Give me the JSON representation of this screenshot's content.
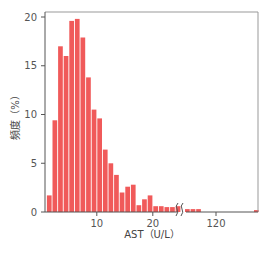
{
  "chart_data": {
    "type": "bar",
    "title": "",
    "xlabel": "AST（U/L）",
    "ylabel": "頻度（%）",
    "ylim": [
      0,
      20
    ],
    "yticks": [
      0,
      5,
      10,
      15,
      20
    ],
    "xticks": [
      {
        "label": "10",
        "x": 10
      },
      {
        "label": "20",
        "x": 20
      },
      {
        "label": "120",
        "x": 120
      }
    ],
    "axis_break": {
      "between": [
        25,
        110
      ],
      "symbol": "//"
    },
    "grid": false,
    "bar_color": "#f05a5a",
    "categories": [
      2,
      3,
      4,
      5,
      6,
      7,
      8,
      9,
      10,
      11,
      12,
      13,
      14,
      15,
      16,
      17,
      18,
      19,
      20,
      21,
      22,
      23,
      24,
      25,
      "111",
      "112",
      "113",
      "118"
    ],
    "values": [
      1.7,
      9.4,
      17.0,
      16.0,
      19.6,
      19.8,
      17.9,
      13.8,
      10.5,
      9.6,
      6.4,
      5.0,
      3.8,
      2.0,
      2.6,
      2.8,
      0.7,
      1.3,
      1.7,
      0.6,
      0.6,
      0.5,
      0.5,
      0.6,
      0.3,
      0.3,
      0.3,
      0.2
    ]
  }
}
